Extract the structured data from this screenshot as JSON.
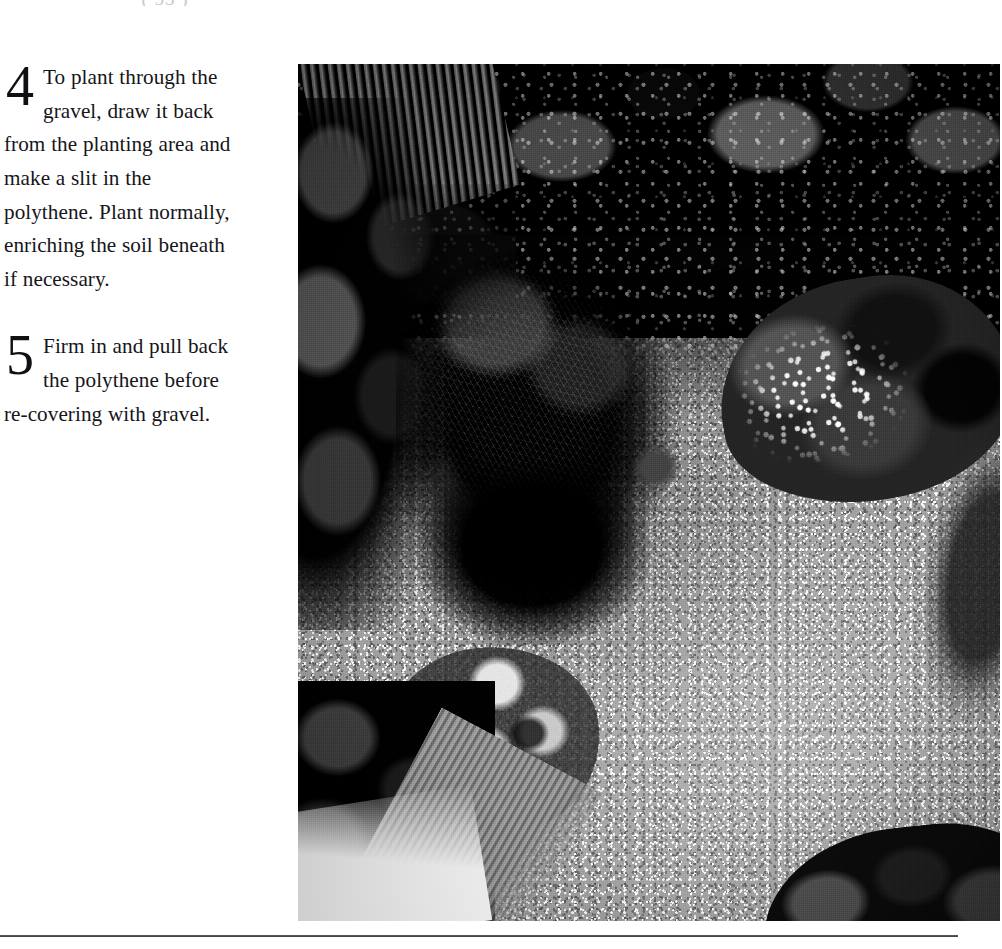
{
  "page": {
    "type": "book-page",
    "running_head": "( 55 )",
    "background_color": "#ffffff",
    "text_color": "#15151a",
    "rule_color": "#2a2a2e"
  },
  "steps": [
    {
      "number": "4",
      "text": "To plant through the gravel, draw it back from the planting area and make a slit in the polythene. Plant normally, enriching the soil beneath if necessary."
    },
    {
      "number": "5",
      "text": "Firm in and pull back the polythene before re-covering with gravel."
    }
  ],
  "photo": {
    "alt": "Black and white photograph of a gravel garden bed: pale gravel mulch covers the ground, a dark feathery bronze fennel shrub stands at centre left, a planting island of low shrubs with small white flowers sits at the right, a clump of pale flowering geraniums grows through the gravel at the lower left beside a wooden edging board, dense dark shrubbery forms the backdrop and a corrugated fence panel appears in the top left corner.",
    "caption": "",
    "elements": [
      "corrugated-fence-panel",
      "dark-shrubbery-backdrop",
      "bronze-fennel-shrub",
      "gravel-mulch",
      "planting-island-white-flowers",
      "small-gravel-tuft",
      "flowering-geranium-clump",
      "wooden-edging-board",
      "paving-corner"
    ]
  }
}
